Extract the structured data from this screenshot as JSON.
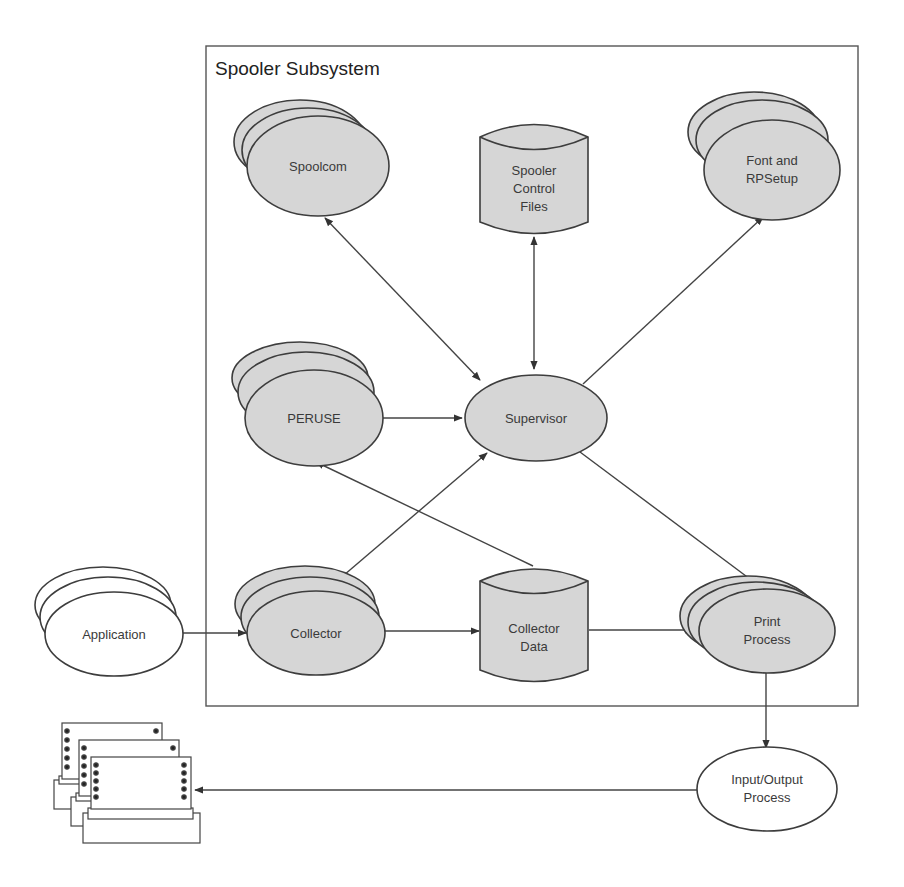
{
  "diagram": {
    "title": "Spooler Subsystem",
    "colors": {
      "node_fill": "#d6d6d6",
      "external_fill": "#ffffff",
      "stroke": "#3d3d3d"
    },
    "nodes": {
      "spoolcom": {
        "label": "Spoolcom",
        "shape": "stacked-ellipse",
        "inside_subsystem": true
      },
      "spooler_control_files": {
        "label_lines": [
          "Spooler",
          "Control",
          "Files"
        ],
        "shape": "data-store",
        "inside_subsystem": true
      },
      "font_rpsetup": {
        "label_lines": [
          "Font and",
          "RPSetup"
        ],
        "shape": "stacked-ellipse",
        "inside_subsystem": true
      },
      "peruse": {
        "label": "PERUSE",
        "shape": "stacked-ellipse",
        "inside_subsystem": true
      },
      "supervisor": {
        "label": "Supervisor",
        "shape": "ellipse",
        "inside_subsystem": true
      },
      "collector": {
        "label": "Collector",
        "shape": "stacked-ellipse",
        "inside_subsystem": true
      },
      "collector_data": {
        "label_lines": [
          "Collector",
          "Data"
        ],
        "shape": "data-store",
        "inside_subsystem": true
      },
      "print_process": {
        "label_lines": [
          "Print",
          "Process"
        ],
        "shape": "stacked-ellipse",
        "inside_subsystem": true
      },
      "application": {
        "label": "Application",
        "shape": "stacked-ellipse",
        "inside_subsystem": false
      },
      "io_process": {
        "label_lines": [
          "Input/Output",
          "Process"
        ],
        "shape": "ellipse",
        "inside_subsystem": false
      },
      "printers": {
        "label": "",
        "shape": "stacked-printer",
        "inside_subsystem": false
      }
    },
    "edges": [
      {
        "from": "spoolcom",
        "to": "supervisor",
        "direction": "both"
      },
      {
        "from": "spooler_control_files",
        "to": "supervisor",
        "direction": "both"
      },
      {
        "from": "supervisor",
        "to": "font_rpsetup",
        "direction": "forward"
      },
      {
        "from": "peruse",
        "to": "supervisor",
        "direction": "forward"
      },
      {
        "from": "collector",
        "to": "supervisor",
        "direction": "both"
      },
      {
        "from": "collector_data",
        "to": "peruse",
        "direction": "forward"
      },
      {
        "from": "supervisor",
        "to": "print_process",
        "direction": "forward"
      },
      {
        "from": "application",
        "to": "collector",
        "direction": "forward"
      },
      {
        "from": "collector",
        "to": "collector_data",
        "direction": "forward"
      },
      {
        "from": "collector_data",
        "to": "print_process",
        "direction": "forward"
      },
      {
        "from": "print_process",
        "to": "io_process",
        "direction": "forward"
      },
      {
        "from": "io_process",
        "to": "printers",
        "direction": "forward"
      }
    ]
  }
}
